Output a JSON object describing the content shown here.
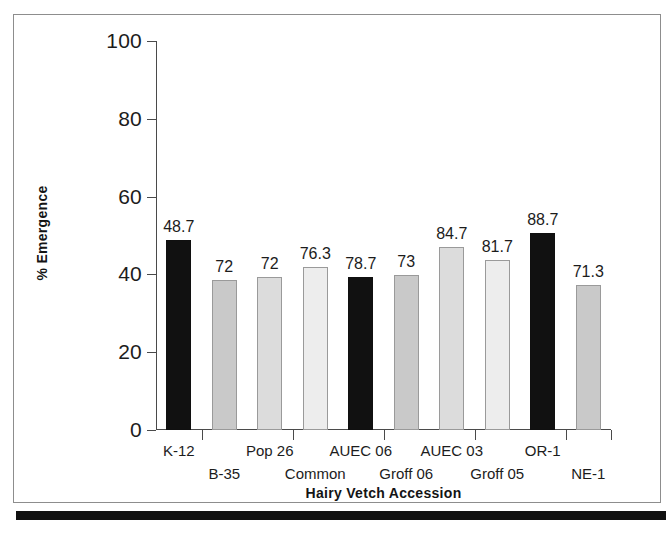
{
  "chart_data": {
    "type": "bar",
    "title": "",
    "xlabel": "Hairy Vetch Accession",
    "ylabel": "% Emergence",
    "ylim": [
      0,
      100
    ],
    "yticks": [
      "0",
      "20",
      "40",
      "60",
      "80",
      "100"
    ],
    "ytick_values": [
      0,
      20,
      40,
      60,
      80,
      100
    ],
    "grid": false,
    "legend": "none",
    "categories": [
      "K-12",
      "B-35",
      "Pop 26",
      "Common",
      "AUEC 06",
      "Groff 06",
      "AUEC 03",
      "Groff 05",
      "OR-1",
      "NE-1"
    ],
    "values": [
      48.7,
      72,
      72,
      76.3,
      78.7,
      73,
      84.7,
      81.7,
      88.7,
      71.3
    ],
    "value_labels": [
      "48.7",
      "72",
      "72",
      "76.3",
      "78.7",
      "73",
      "84.7",
      "81.7",
      "88.7",
      "71.3"
    ],
    "bar_colors": [
      "#111111",
      "#c9c9c9",
      "#dcdcdc",
      "#ededed",
      "#111111",
      "#c9c9c9",
      "#dcdcdc",
      "#ededed",
      "#111111",
      "#c9c9c9"
    ],
    "bar_heights_px": [
      190,
      150,
      153,
      163,
      153,
      155,
      183,
      170,
      197,
      145
    ],
    "label_rows": [
      "a",
      "b",
      "a",
      "b",
      "a",
      "b",
      "a",
      "b",
      "a",
      "b"
    ]
  },
  "axis": {
    "y_title": "% Emergence",
    "x_title": "Hairy Vetch Accession"
  },
  "colors": {
    "frame": "#8d8d8d",
    "axis": "#4a4a4a",
    "text": "#1c1c1c",
    "rule": "#111111"
  }
}
